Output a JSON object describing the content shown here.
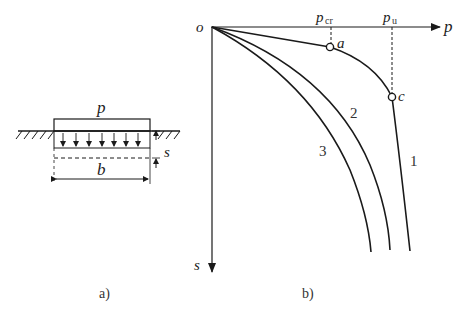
{
  "figure_a": {
    "caption": "a)",
    "load_label": "p",
    "width_label": "b",
    "settlement_label": "s",
    "load_arrow_count": 8
  },
  "figure_b": {
    "caption": "b)",
    "origin_label": "o",
    "x_axis_label": "p",
    "y_axis_label": "s",
    "p_cr_label": "p",
    "p_cr_sub": "cr",
    "p_u_label": "p",
    "p_u_sub": "u",
    "point_a_label": "a",
    "point_c_label": "c",
    "curve_labels": [
      "1",
      "2",
      "3"
    ]
  },
  "colors": {
    "line": "#1a1a1a",
    "text": "#222222",
    "background": "#ffffff"
  }
}
